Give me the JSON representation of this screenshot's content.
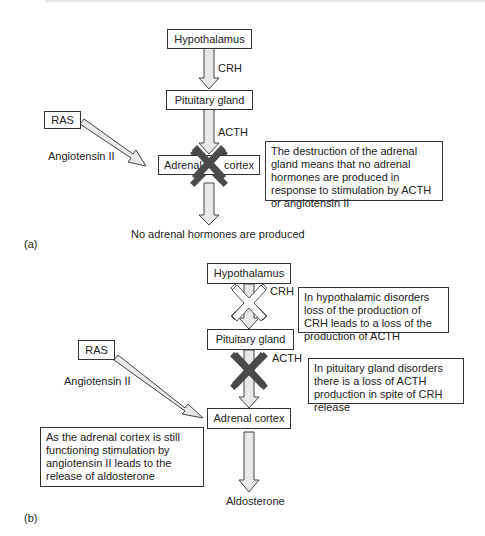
{
  "panel_a": {
    "label": "(a)",
    "nodes": {
      "hypothalamus": "Hypothalamus",
      "pituitary": "Pituitary gland",
      "ras": "RAS",
      "adrenal_left": "Adrenal",
      "adrenal_right": "cortex"
    },
    "edges": {
      "crh": "CRH",
      "acth": "ACTH",
      "angiotensin": "Angiotensin II"
    },
    "note": "The destruction of the adrenal gland means that no adrenal hormones are produced in response to stimulation by ACTH or angiotensin II",
    "output": "No adrenal hormones are produced",
    "block_color": "#4a4a4a"
  },
  "panel_b": {
    "label": "(b)",
    "nodes": {
      "hypothalamus": "Hypothalamus",
      "pituitary": "Pituitary gland",
      "ras": "RAS",
      "adrenal": "Adrenal cortex"
    },
    "edges": {
      "crh": "CRH",
      "acth": "ACTH",
      "angiotensin": "Angiotensin II"
    },
    "notes": {
      "hypothalamic": "In hypothalamic disorders loss of the production of CRH leads to a loss of the production of ACTH",
      "pituitary": "In pituitary gland disorders there is a loss of ACTH production in spite of CRH release",
      "adrenal": "As the adrenal cortex is still functioning stimulation by angiotensin II leads to the release of aldosterone"
    },
    "output": "Aldosterone",
    "block_color": "#4a4a4a",
    "open_block_color": "#ffffff"
  }
}
